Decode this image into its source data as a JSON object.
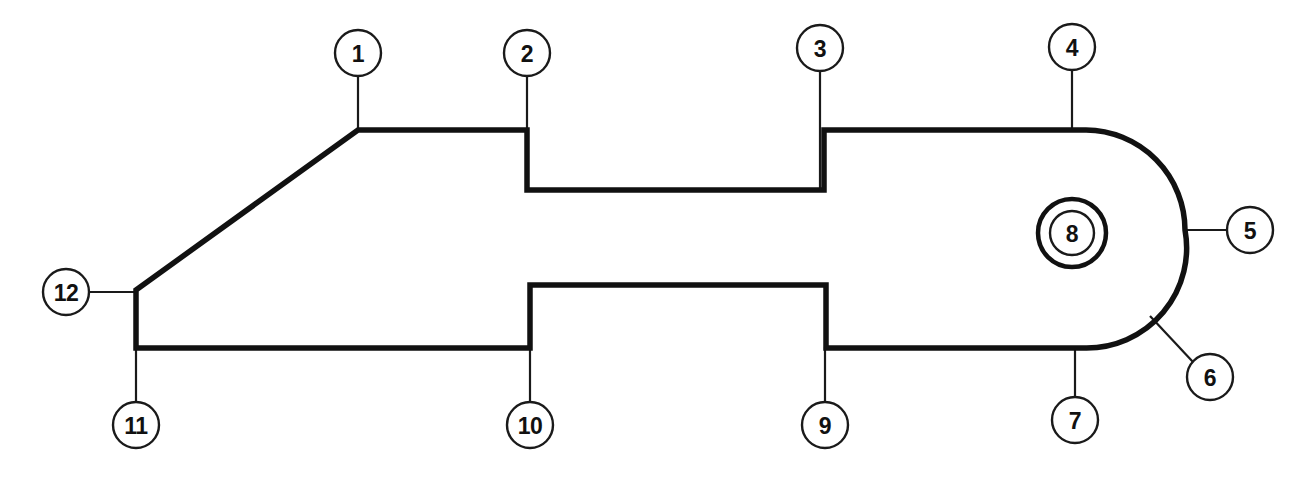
{
  "diagram": {
    "type": "technical-part-outline",
    "canvas": {
      "width": 1301,
      "height": 477
    },
    "colors": {
      "background": "#ffffff",
      "outline": "#111111",
      "leader": "#1a1a1a",
      "callout_fill": "#ffffff",
      "callout_stroke": "#1a1a1a",
      "label_text": "#111111"
    },
    "stroke_widths": {
      "outline": 5.5,
      "feature_ring": 4.5,
      "leader": 2.2,
      "callout": 2.4
    },
    "outline_path": "M 136 290 L 358 130 L 527 130 L 527 190 L 824 190 L 824 130 L 1086 130 A 100 100 0 0 1 1185 230 A 100 100 0 0 1 1086 348 L 826 348 L 826 285 L 530 285 L 530 348 L 136 348 Z",
    "feature": {
      "name": "concentric-hole",
      "center_x": 1072,
      "center_y": 233,
      "outer_radius": 34,
      "inner_radius": 22
    },
    "callouts": [
      {
        "id": "1",
        "label": "1",
        "cx": 358,
        "cy": 53,
        "r": 23,
        "leader": {
          "x1": 358,
          "y1": 76,
          "x2": 358,
          "y2": 131
        }
      },
      {
        "id": "2",
        "label": "2",
        "cx": 527,
        "cy": 53,
        "r": 23,
        "leader": {
          "x1": 527,
          "y1": 76,
          "x2": 527,
          "y2": 131
        }
      },
      {
        "id": "3",
        "label": "3",
        "cx": 820,
        "cy": 48,
        "r": 23,
        "leader": {
          "x1": 820,
          "y1": 71,
          "x2": 820,
          "y2": 190
        }
      },
      {
        "id": "4",
        "label": "4",
        "cx": 1072,
        "cy": 47,
        "r": 23,
        "leader": {
          "x1": 1072,
          "y1": 70,
          "x2": 1072,
          "y2": 131
        }
      },
      {
        "id": "5",
        "label": "5",
        "cx": 1250,
        "cy": 230,
        "r": 23,
        "leader": {
          "x1": 1227,
          "y1": 230,
          "x2": 1183,
          "y2": 230
        }
      },
      {
        "id": "6",
        "label": "6",
        "cx": 1210,
        "cy": 377,
        "r": 23,
        "leader": {
          "x1": 1193,
          "y1": 362,
          "x2": 1150,
          "y2": 316
        }
      },
      {
        "id": "7",
        "label": "7",
        "cx": 1075,
        "cy": 420,
        "r": 23,
        "leader": {
          "x1": 1075,
          "y1": 397,
          "x2": 1075,
          "y2": 347
        }
      },
      {
        "id": "8",
        "label": "8",
        "cx": 1072,
        "cy": 233,
        "r": 22,
        "leader": null
      },
      {
        "id": "9",
        "label": "9",
        "cx": 825,
        "cy": 425,
        "r": 23,
        "leader": {
          "x1": 825,
          "y1": 402,
          "x2": 825,
          "y2": 347
        }
      },
      {
        "id": "10",
        "label": "10",
        "cx": 530,
        "cy": 425,
        "r": 23,
        "leader": {
          "x1": 530,
          "y1": 402,
          "x2": 530,
          "y2": 347
        }
      },
      {
        "id": "11",
        "label": "11",
        "cx": 136,
        "cy": 425,
        "r": 23,
        "leader": {
          "x1": 136,
          "y1": 402,
          "x2": 136,
          "y2": 347
        }
      },
      {
        "id": "12",
        "label": "12",
        "cx": 66,
        "cy": 292,
        "r": 23,
        "leader": {
          "x1": 89,
          "y1": 292,
          "x2": 137,
          "y2": 292
        }
      }
    ]
  }
}
